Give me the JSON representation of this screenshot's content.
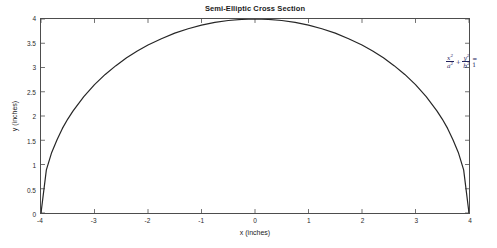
{
  "chart_data": {
    "type": "line",
    "title": "Semi-Elliptic Cross Section",
    "xlabel": "x (inches)",
    "ylabel": "y (inches)",
    "xlim": [
      -4,
      4
    ],
    "ylim": [
      0,
      4
    ],
    "xticks": [
      "-4",
      "-3",
      "-2",
      "-1",
      "0",
      "1",
      "2",
      "3",
      "4"
    ],
    "xtick_values": [
      -4,
      -3,
      -2,
      -1,
      0,
      1,
      2,
      3,
      4
    ],
    "yticks": [
      "0",
      "0.5",
      "1",
      "1.5",
      "2",
      "2.5",
      "3",
      "3.5",
      "4"
    ],
    "ytick_values": [
      0,
      0.5,
      1,
      1.5,
      2,
      2.5,
      3,
      3.5,
      4
    ],
    "grid": false,
    "legend": null,
    "series": [
      {
        "name": "Semi-ellipse upper boundary",
        "color": "#262626",
        "linewidth": 1,
        "equation": "y = b*sqrt(1 - x^2/a^2)",
        "semi_axis_a": 4,
        "semi_axis_b": 4,
        "x": [
          -4,
          -3.9,
          -3.8,
          -3.7,
          -3.6,
          -3.5,
          -3.4,
          -3.2,
          -3,
          -2.8,
          -2.6,
          -2.4,
          -2.2,
          -2,
          -1.75,
          -1.5,
          -1.25,
          -1,
          -0.75,
          -0.5,
          -0.25,
          0,
          0.25,
          0.5,
          0.75,
          1,
          1.25,
          1.5,
          1.75,
          2,
          2.2,
          2.4,
          2.6,
          2.8,
          3,
          3.2,
          3.4,
          3.5,
          3.6,
          3.7,
          3.8,
          3.9,
          4
        ],
        "y": [
          0,
          0.889,
          1.249,
          1.51,
          1.744,
          1.937,
          2.107,
          2.4,
          2.646,
          2.857,
          3.038,
          3.2,
          3.342,
          3.464,
          3.594,
          3.708,
          3.8,
          3.873,
          3.929,
          3.969,
          3.992,
          4,
          3.992,
          3.969,
          3.929,
          3.873,
          3.8,
          3.708,
          3.594,
          3.464,
          3.342,
          3.2,
          3.038,
          2.857,
          2.646,
          2.4,
          2.107,
          1.937,
          1.744,
          1.51,
          1.249,
          0.889,
          0
        ]
      }
    ],
    "annotations": [
      {
        "name": "ellipse-equation",
        "text": "x^2/a^2 + y^2/b^2 = 1",
        "x_data": 3.3,
        "y_data": 3.6,
        "color": "#23235c"
      }
    ]
  },
  "annotation_parts": {
    "num1": "x",
    "num1_exp": "2",
    "den1": "a",
    "den1_exp": "2",
    "plus": "+",
    "num2": "y",
    "num2_exp": "2",
    "den2": "b",
    "den2_exp": "2",
    "equals": "= 1"
  },
  "axes": {
    "box_color": "#4d4d4d",
    "background": "#ffffff"
  }
}
